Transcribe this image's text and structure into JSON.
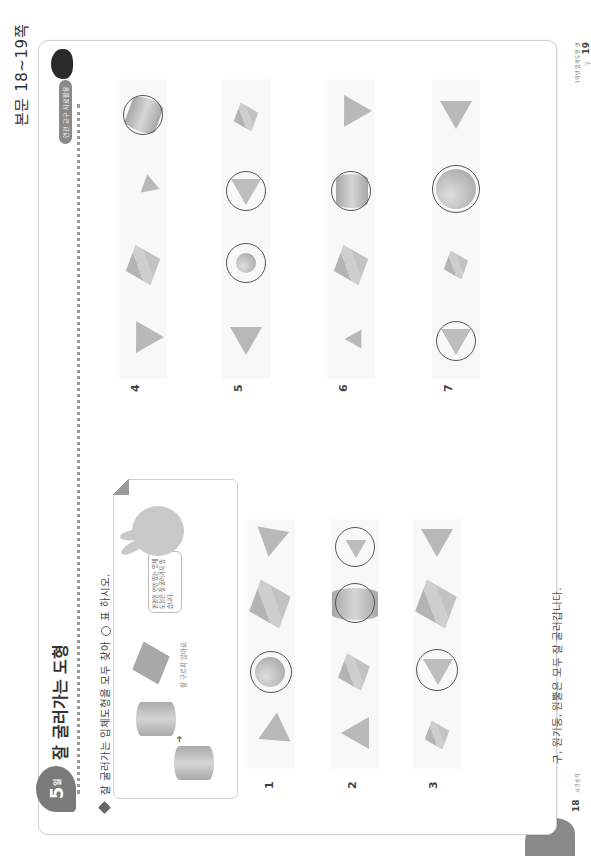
{
  "header": {
    "page_ref": "본문 18~19쪽"
  },
  "left_page": {
    "day_badge": {
      "number": "5",
      "suffix": "일"
    },
    "title": "잘 굴러가는 도형",
    "instruction": {
      "before": "잘 굴러가는 입체도형을 모두 찾아",
      "after": "표 하시오."
    },
    "example": {
      "caption": "잘 구르지 않아요",
      "speech_bubble": "평평한 면만 있는 입체도형은 잘 굴러가지 않습니다."
    },
    "problems": [
      {
        "number": "1",
        "shapes": [
          "사각뿔",
          "구",
          "정육면체",
          "삼각뿔"
        ],
        "circled": [
          false,
          true,
          false,
          false
        ]
      },
      {
        "number": "2",
        "shapes": [
          "사각뿔",
          "정육면체",
          "원기둥",
          "원뿔"
        ],
        "circled": [
          false,
          false,
          true,
          true
        ]
      },
      {
        "number": "3",
        "shapes": [
          "정육면체",
          "원뿔",
          "정육면체",
          "삼각뿔"
        ],
        "circled": [
          false,
          true,
          false,
          false
        ]
      }
    ],
    "note": "구, 원기둥, 원뿔은 모두 잘 굴러갑니다.",
    "footer": {
      "page_number": "18",
      "publisher": "시간생각"
    }
  },
  "right_page": {
    "badge": "연관 교구 자료활용",
    "problems": [
      {
        "number": "4",
        "shapes": [
          "사각뿔",
          "정육면체",
          "삼각뿔",
          "원기둥"
        ],
        "circled": [
          false,
          false,
          false,
          true
        ]
      },
      {
        "number": "5",
        "shapes": [
          "사각뿔",
          "구",
          "원뿔",
          "정육면체"
        ],
        "circled": [
          false,
          true,
          true,
          false
        ]
      },
      {
        "number": "6",
        "shapes": [
          "사각뿔",
          "정육면체",
          "원기둥",
          "사각뿔"
        ],
        "circled": [
          false,
          false,
          true,
          false
        ]
      },
      {
        "number": "7",
        "shapes": [
          "원뿔",
          "정육면체",
          "구",
          "사각뿔"
        ],
        "circled": [
          true,
          false,
          true,
          false
        ]
      }
    ],
    "footer": {
      "page_number": "19",
      "series": "1학년 입체도형 연구"
    }
  }
}
